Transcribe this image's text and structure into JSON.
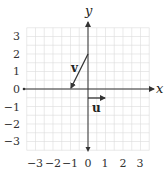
{
  "figure": {
    "x_axis_label": "x",
    "y_axis_label": "y",
    "x_ticks": [
      "−3",
      "−2",
      "−1",
      "0",
      "1",
      "2",
      "3"
    ],
    "y_ticks": [
      "3",
      "2",
      "1",
      "0",
      "−1",
      "−2",
      "−3"
    ],
    "vectors": [
      {
        "label": "v",
        "tail": [
          0,
          2
        ],
        "head": [
          -1,
          0
        ]
      },
      {
        "label": "u",
        "tail": [
          0,
          -0.5
        ],
        "head": [
          1,
          -0.5
        ]
      }
    ],
    "grid": {
      "range": [
        -3.5,
        3.5
      ],
      "minor_step": 0.5
    },
    "colors": {
      "grid": "#dcdcdc",
      "axis": "#333333",
      "vector": "#333333"
    }
  }
}
